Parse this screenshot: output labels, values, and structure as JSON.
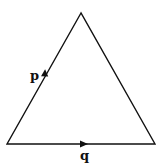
{
  "diagram": {
    "shape": "equilateral-triangle",
    "stroke_color": "#111111",
    "vertices": {
      "apex": [
        81,
        13
      ],
      "bottom_left": [
        7,
        144
      ],
      "bottom_right": [
        155,
        144
      ]
    },
    "vectors": [
      {
        "label": "p",
        "side": "left",
        "direction": "up-right"
      },
      {
        "label": "q",
        "side": "bottom",
        "direction": "right"
      }
    ]
  }
}
